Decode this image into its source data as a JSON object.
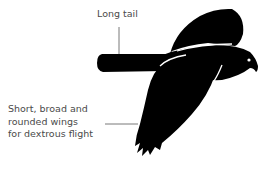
{
  "figure": {
    "colors": {
      "silhouette": "#000000",
      "background": "#ffffff",
      "text": "#4a4a4a",
      "leader_line": "#555555"
    }
  },
  "annotations": {
    "tail": {
      "line1": "Long tail"
    },
    "wings": {
      "line1": "Short, broad and",
      "line2": "rounded wings",
      "line3": "for dextrous flight"
    }
  }
}
